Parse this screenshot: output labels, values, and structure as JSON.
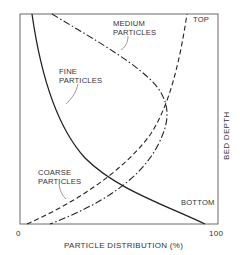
{
  "diagram": {
    "type": "particle distribution vs bed depth",
    "x_axis": {
      "label": "PARTICLE DISTRIBUTION (%)",
      "min_label": "0",
      "max_label": "100"
    },
    "y_axis": {
      "label": "BED DEPTH",
      "top_label": "TOP",
      "bottom_label": "BOTTOM"
    },
    "curves": [
      {
        "name": "fine",
        "label_line1": "FINE",
        "label_line2": "PARTICLES",
        "style": "solid"
      },
      {
        "name": "medium",
        "label_line1": "MEDIUM",
        "label_line2": "PARTICLES",
        "style": "dash-dot"
      },
      {
        "name": "coarse",
        "label_line1": "COARSE",
        "label_line2": "PARTICLES",
        "style": "dashed"
      }
    ],
    "colors": {
      "line": "#222222",
      "frame": "#666666",
      "text": "#333333",
      "background": "#ffffff"
    }
  }
}
